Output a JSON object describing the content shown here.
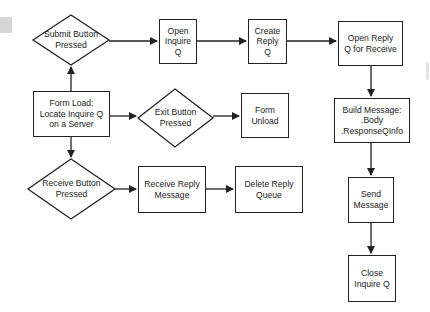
{
  "diagram": {
    "type": "flowchart",
    "nodes": {
      "submit": {
        "shape": "diamond",
        "label": "Submit Button\nPressed"
      },
      "open_inquire": {
        "shape": "box",
        "label": "Open\nInquire\nQ"
      },
      "create_reply": {
        "shape": "box",
        "label": "Create\nReply\nQ"
      },
      "open_reply": {
        "shape": "box",
        "label": "Open Reply\nQ for Receive"
      },
      "form_load": {
        "shape": "box",
        "label": "Form Load:\nLocate Inquire Q\non a Server"
      },
      "exit": {
        "shape": "diamond",
        "label": "Exit Button\nPressed"
      },
      "form_unload": {
        "shape": "box",
        "label": "Form\nUnload"
      },
      "build_message": {
        "shape": "box",
        "label": "Build Message:\n.Body\n.ResponseQInfo"
      },
      "receive": {
        "shape": "diamond",
        "label": "Receive Button\nPressed"
      },
      "receive_reply": {
        "shape": "box",
        "label": "Receive Reply\nMessage"
      },
      "delete_reply": {
        "shape": "box",
        "label": "Delete Reply\nQueue"
      },
      "send_message": {
        "shape": "box",
        "label": "Send\nMessage"
      },
      "close_inquire": {
        "shape": "box",
        "label": "Close\nInquire Q"
      }
    },
    "edges": [
      {
        "from": "form_load",
        "to": "submit"
      },
      {
        "from": "form_load",
        "to": "exit"
      },
      {
        "from": "form_load",
        "to": "receive"
      },
      {
        "from": "submit",
        "to": "open_inquire"
      },
      {
        "from": "open_inquire",
        "to": "create_reply"
      },
      {
        "from": "create_reply",
        "to": "open_reply"
      },
      {
        "from": "open_reply",
        "to": "build_message"
      },
      {
        "from": "build_message",
        "to": "send_message"
      },
      {
        "from": "send_message",
        "to": "close_inquire"
      },
      {
        "from": "exit",
        "to": "form_unload"
      },
      {
        "from": "receive",
        "to": "receive_reply"
      },
      {
        "from": "receive_reply",
        "to": "delete_reply"
      }
    ],
    "colors": {
      "stroke": "#222222",
      "background": "#ffffff",
      "text": "#222222"
    }
  }
}
